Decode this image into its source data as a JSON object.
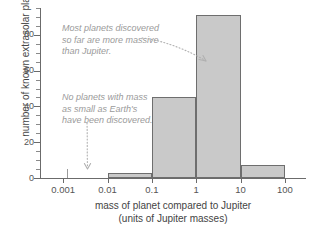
{
  "chart_data": {
    "type": "bar",
    "title": "",
    "xlabel": "mass of planet compared to Jupiter",
    "xlabel_sub": "(units of Jupiter masses)",
    "ylabel": "number of known extrasolar planets",
    "xscale": "log",
    "xlim": [
      0.0003,
      300
    ],
    "ylim": [
      0,
      95
    ],
    "grid": false,
    "legend": "none",
    "xtick_labels": [
      "0.001",
      "0.01",
      "0.1",
      "1",
      "10",
      "100"
    ],
    "xtick_values": [
      0.001,
      0.01,
      0.1,
      1,
      10,
      100
    ],
    "ytick_labels": [
      "0",
      "20",
      "40",
      "60",
      "80"
    ],
    "ytick_values": [
      0,
      20,
      40,
      60,
      80
    ],
    "yminor_step": 5,
    "bin_edges": [
      0.001,
      0.01,
      0.1,
      1,
      10,
      100
    ],
    "categories": [
      "0.001-0.01",
      "0.01-0.1",
      "0.1-1",
      "1-10",
      "10-100"
    ],
    "values": [
      0,
      3,
      45,
      91,
      7
    ],
    "bar_color": "#c9c9c9",
    "bar_edge_color": "#6e6e6e",
    "axis_color": "#6b6b6b",
    "annotation_color": "#9a9a9a"
  },
  "annotations": {
    "massive": "Most planets discovered\nso far are more massive\nthan Jupiter.",
    "earth": "No planets with mass\nas small as Earth's\nhave been discovered."
  },
  "axes": {
    "y_title": "number of known extrasolar planets",
    "x_title": "mass of planet compared to Jupiter",
    "x_title_units": "(units of Jupiter masses)"
  }
}
